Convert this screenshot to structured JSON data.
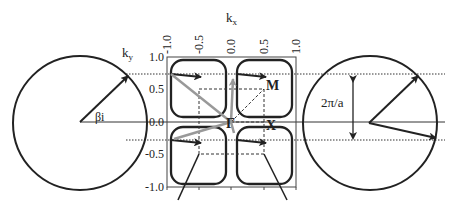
{
  "diagram": {
    "left_circle": {
      "angle_label": "βi",
      "axis_label": "k",
      "axis_sub": "y"
    },
    "plot": {
      "x_axis_label": "k",
      "x_axis_sub": "x",
      "x_ticks": [
        "-1.0",
        "-0.5",
        "0.0",
        "0.5",
        "1.0"
      ],
      "y_ticks": [
        "1.0",
        "0.5",
        "0.0",
        "-0.5",
        "-1.0"
      ],
      "points": {
        "gamma": "Γ",
        "m": "M",
        "x": "X"
      }
    },
    "right_circle": {
      "spacing_label": "2π/a"
    },
    "colors": {
      "stroke": "#222222",
      "grey_arrow": "#999999"
    }
  }
}
